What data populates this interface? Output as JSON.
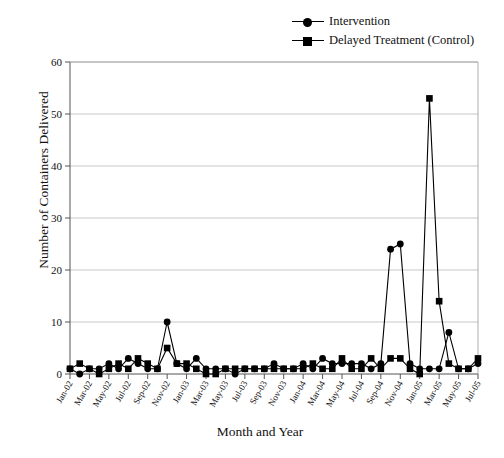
{
  "chart_data": {
    "type": "line",
    "title": "",
    "xlabel": "Month and Year",
    "ylabel": "Number of Containers Delivered",
    "ylim": [
      0,
      60
    ],
    "yticks": [
      0,
      10,
      20,
      30,
      40,
      50,
      60
    ],
    "grid": true,
    "legend_position": "top-right",
    "x": [
      "Jan-02",
      "Feb-02",
      "Mar-02",
      "Apr-02",
      "May-02",
      "Jun-02",
      "Jul-02",
      "Aug-02",
      "Sep-02",
      "Oct-02",
      "Nov-02",
      "Dec-02",
      "Jan-03",
      "Feb-03",
      "Mar-03",
      "Apr-03",
      "May-03",
      "Jun-03",
      "Jul-03",
      "Aug-03",
      "Sep-03",
      "Oct-03",
      "Nov-03",
      "Dec-03",
      "Jan-04",
      "Feb-04",
      "Mar-04",
      "Apr-04",
      "May-04",
      "Jun-04",
      "Jul-04",
      "Aug-04",
      "Sep-04",
      "Oct-04",
      "Nov-04",
      "Dec-04",
      "Jan-05",
      "Feb-05",
      "Mar-05",
      "Apr-05",
      "May-05",
      "Jun-05",
      "Jul-05"
    ],
    "tick_labels": [
      "Jan-02",
      "Mar-02",
      "May-02",
      "Jul-02",
      "Sep-02",
      "Nov-02",
      "Jan-03",
      "Mar-03",
      "May-03",
      "Jul-03",
      "Sep-03",
      "Nov-03",
      "Jan-04",
      "Mar-04",
      "May-04",
      "Jul-04",
      "Sep-04",
      "Nov-04",
      "Jan-05",
      "Mar-05",
      "May-05",
      "Jul-05"
    ],
    "series": [
      {
        "name": "Intervention",
        "marker": "circle",
        "values": [
          1,
          0,
          1,
          1,
          2,
          1,
          3,
          2,
          1,
          1,
          10,
          2,
          1,
          3,
          1,
          1,
          1,
          0,
          1,
          1,
          1,
          2,
          1,
          1,
          2,
          1,
          3,
          2,
          2,
          2,
          2,
          1,
          2,
          24,
          25,
          2,
          1,
          1,
          1,
          8,
          1,
          1,
          2
        ]
      },
      {
        "name": "Delayed Treatment (Control)",
        "marker": "square",
        "values": [
          1,
          2,
          1,
          0,
          1,
          2,
          1,
          3,
          2,
          1,
          5,
          2,
          2,
          1,
          0,
          0,
          1,
          1,
          1,
          1,
          1,
          1,
          1,
          1,
          1,
          2,
          1,
          1,
          3,
          1,
          1,
          3,
          1,
          3,
          3,
          1,
          0,
          53,
          14,
          2,
          1,
          1,
          3
        ]
      }
    ]
  },
  "legend": {
    "items": [
      {
        "label": "Intervention",
        "marker": "circle"
      },
      {
        "label": "Delayed Treatment (Control)",
        "marker": "square"
      }
    ]
  },
  "axes": {
    "ylabel": "Number of Containers Delivered",
    "xlabel": "Month and Year"
  }
}
